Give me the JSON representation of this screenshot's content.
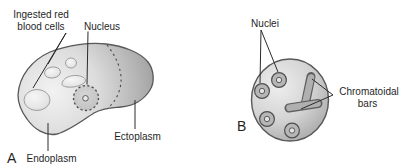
{
  "colors": {
    "background": "#ffffff",
    "outline": "#58585a",
    "leader": "#2b2b2b",
    "text": "#1f1f1f",
    "cell_light": "#f2f2f2",
    "cell_mid": "#d8d8d8",
    "cell_dark": "#9c9c9c",
    "organelle_light": "#f6f6f6",
    "organelle_shade": "#cfcfcf",
    "nucleus_fill": "#c6c6c6",
    "bar_fill": "#b0b0b0",
    "bar_outline": "#5f5f5f"
  },
  "panel_a": {
    "letter": "A",
    "labels": {
      "ingested_line1": "Ingested red",
      "ingested_line2": "blood cells",
      "nucleus": "Nucleus",
      "ectoplasm": "Ectoplasm",
      "endoplasm": "Endoplasm"
    }
  },
  "panel_b": {
    "letter": "B",
    "labels": {
      "nuclei": "Nuclei",
      "chromatoidal_line1": "Chromatoidal",
      "chromatoidal_line2": "bars"
    }
  }
}
